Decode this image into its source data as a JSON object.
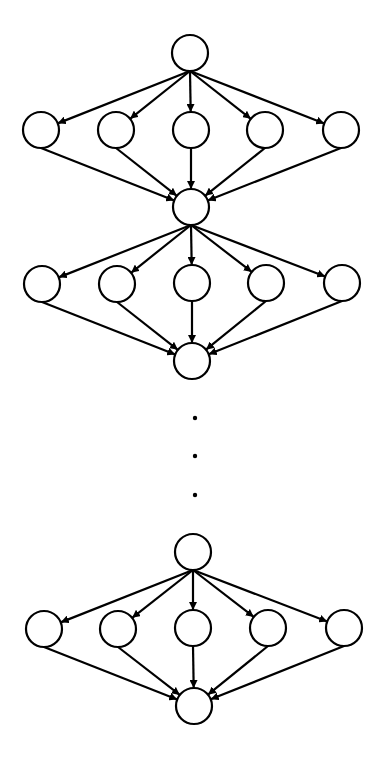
{
  "diagram": {
    "type": "repeated fan-out/fan-in directed graph",
    "node_radius": 18,
    "stroke_color": "#000000",
    "background": "#ffffff",
    "blocks": [
      {
        "source": {
          "x": 190,
          "y": 53
        },
        "middle": [
          {
            "x": 41,
            "y": 130
          },
          {
            "x": 116,
            "y": 130
          },
          {
            "x": 191,
            "y": 130
          },
          {
            "x": 265,
            "y": 130
          },
          {
            "x": 341,
            "y": 130
          }
        ],
        "sink": {
          "x": 191,
          "y": 207
        }
      },
      {
        "source": {
          "x": 191,
          "y": 207
        },
        "middle": [
          {
            "x": 42,
            "y": 284
          },
          {
            "x": 117,
            "y": 284
          },
          {
            "x": 192,
            "y": 283
          },
          {
            "x": 266,
            "y": 283
          },
          {
            "x": 342,
            "y": 283
          }
        ],
        "sink": {
          "x": 192,
          "y": 361
        }
      },
      {
        "source": {
          "x": 193,
          "y": 552
        },
        "middle": [
          {
            "x": 44,
            "y": 629
          },
          {
            "x": 118,
            "y": 629
          },
          {
            "x": 193,
            "y": 628
          },
          {
            "x": 268,
            "y": 628
          },
          {
            "x": 344,
            "y": 628
          }
        ],
        "sink": {
          "x": 194,
          "y": 706
        }
      }
    ],
    "ellipsis_dots": [
      {
        "x": 195,
        "y": 418
      },
      {
        "x": 195,
        "y": 456
      },
      {
        "x": 195,
        "y": 495
      }
    ]
  }
}
